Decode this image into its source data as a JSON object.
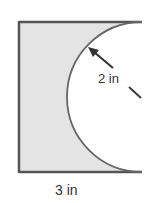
{
  "diagram": {
    "shape": "rectangle with semicircle removed",
    "labels": {
      "radius": "2 in",
      "width": "3 in"
    },
    "colors": {
      "fill": "#e4e4e4",
      "stroke": "#555555",
      "text": "#333333",
      "background": "#ffffff"
    }
  }
}
